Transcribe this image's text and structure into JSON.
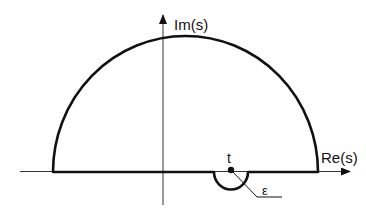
{
  "diagram": {
    "type": "contour-integration",
    "axes": {
      "imaginary_label": "Im(s)",
      "real_label": "Re(s)"
    },
    "point": {
      "label": "t"
    },
    "indent_radius_label": "ε",
    "colors": {
      "stroke": "#111111",
      "background": "#ffffff"
    }
  }
}
